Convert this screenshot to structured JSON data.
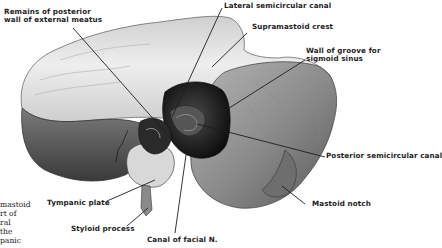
{
  "figure": {
    "colors": {
      "background": "#ffffff",
      "ink": "#1e1e1e",
      "bone_light": "#e6e6e6",
      "bone_mid": "#9a9a9a",
      "bone_dark": "#2a2a2a"
    }
  },
  "labels": {
    "remains_posterior_wall": [
      "Remains of posterior",
      "wall of external meatus"
    ],
    "lateral_semicircular_canal": "Lateral semicircular canal",
    "supramastoid_crest": "Supramastoid crest",
    "wall_of_groove": [
      "Wall of groove for",
      "sigmoid sinus"
    ],
    "posterior_semicircular_canal": "Posterior semicircular canal",
    "mastoid_notch": "Mastoid notch",
    "tympanic_plate": "Tympanic plate",
    "styloid_process": "Styloid process",
    "canal_of_facial_n": "Canal of facial N."
  },
  "left_caption_fragment": [
    "mastoid",
    "rt of",
    "ral",
    "the",
    "panic"
  ]
}
